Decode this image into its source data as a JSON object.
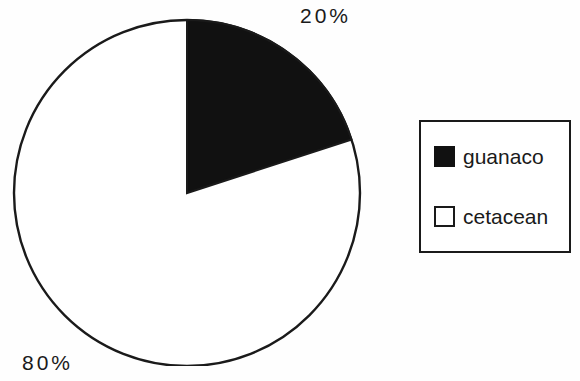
{
  "figure": {
    "background_color": "#fefefe",
    "ink_color": "#1a1a1a"
  },
  "chart_data": {
    "type": "pie",
    "title": "",
    "subtitle": "",
    "xlabel": "",
    "ylabel": "",
    "grid": false,
    "legend_position": "right",
    "start_angle_deg": 90,
    "direction": "clockwise",
    "categories": [
      "guanaco",
      "cetacean"
    ],
    "values": [
      20,
      80
    ],
    "value_unit": "%",
    "colors": [
      "#111111",
      "#ffffff"
    ],
    "edge_color": "#1a1a1a",
    "data_labels": [
      "20%",
      "80%"
    ],
    "slices": [
      {
        "name": "guanaco",
        "value": 20,
        "label": "20%",
        "color": "#111111",
        "swatch": "filled-black"
      },
      {
        "name": "cetacean",
        "value": 80,
        "label": "80%",
        "color": "#ffffff",
        "swatch": "open-white"
      }
    ],
    "annotations": [
      {
        "text": "20%",
        "position": "top-right"
      },
      {
        "text": "80%",
        "position": "bottom-left"
      }
    ]
  },
  "legend": {
    "items": [
      {
        "label": "guanaco",
        "swatch": "filled-black"
      },
      {
        "label": "cetacean",
        "swatch": "open-white"
      }
    ]
  }
}
